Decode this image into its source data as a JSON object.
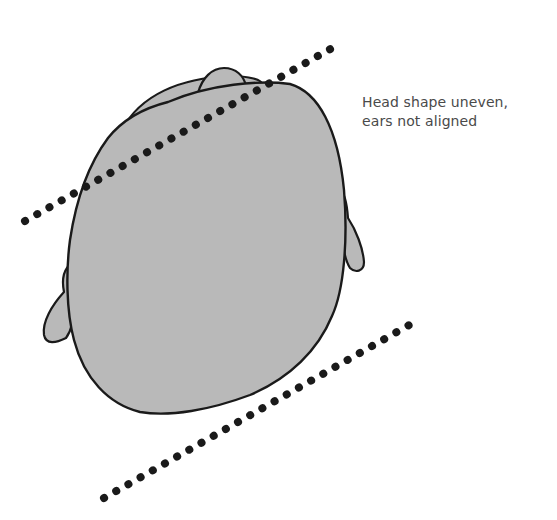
{
  "figure": {
    "type": "illustration",
    "caption": {
      "line1": "Head shape uneven,",
      "line2": "ears not aligned"
    },
    "colors": {
      "head_fill": "#b9b9b9",
      "outline": "#1a1a1a",
      "dots": "#1a1a1a",
      "caption_text": "#4a4a4a",
      "background": "#ffffff"
    },
    "guide_lines": [
      {
        "name": "upper-ear-alignment-line",
        "from": [
          25,
          221
        ],
        "to": [
          341,
          43
        ],
        "style": "dotted"
      },
      {
        "name": "lower-head-alignment-line",
        "from": [
          104,
          498
        ],
        "to": [
          418,
          320
        ],
        "style": "dotted"
      }
    ]
  }
}
